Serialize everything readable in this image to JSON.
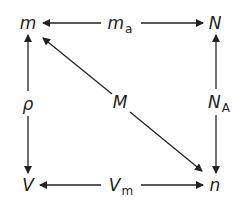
{
  "diagram": {
    "nodes": {
      "m": {
        "label": "m"
      },
      "ma": {
        "label": "m",
        "sub": "a"
      },
      "N": {
        "label": "N"
      },
      "rho": {
        "label": "ρ"
      },
      "M": {
        "label": "M"
      },
      "NA": {
        "label": "N",
        "sub": "A"
      },
      "V": {
        "label": "V"
      },
      "Vm": {
        "label": "V",
        "sub": "m"
      },
      "n": {
        "label": "n"
      }
    },
    "edges": [
      {
        "from": "ma",
        "to": "m"
      },
      {
        "from": "ma",
        "to": "N"
      },
      {
        "from": "rho",
        "to": "m"
      },
      {
        "from": "rho",
        "to": "V"
      },
      {
        "from": "M",
        "to": "m"
      },
      {
        "from": "M",
        "to": "n"
      },
      {
        "from": "NA",
        "to": "N"
      },
      {
        "from": "NA",
        "to": "n"
      },
      {
        "from": "Vm",
        "to": "V"
      },
      {
        "from": "Vm",
        "to": "n"
      }
    ],
    "line_color": "#222222"
  }
}
